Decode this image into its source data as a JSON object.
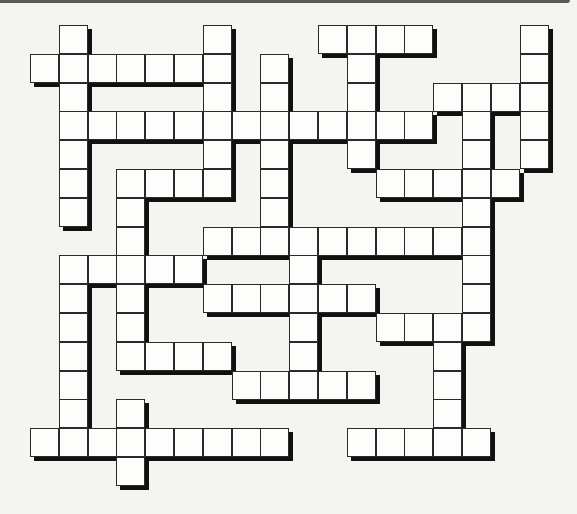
{
  "puzzle": {
    "type": "crossword",
    "cell_size_px": 29,
    "origin_px": {
      "x": 30,
      "y": 25
    },
    "cols": 18,
    "rows": 16,
    "colors": {
      "background": "#f4f4f1",
      "cell_fill": "#fdfdfc",
      "cell_border": "#2a2a2a",
      "shadow": "#111111",
      "top_bar": "#5a5a5a"
    },
    "rows_cells": [
      [
        1,
        6,
        10,
        11,
        12,
        13,
        17
      ],
      [
        0,
        1,
        2,
        3,
        4,
        5,
        6,
        8,
        11,
        17
      ],
      [
        1,
        6,
        8,
        11,
        14,
        15,
        16,
        17
      ],
      [
        1,
        2,
        3,
        4,
        5,
        6,
        7,
        8,
        9,
        10,
        11,
        12,
        13,
        15,
        17
      ],
      [
        1,
        6,
        8,
        11,
        15,
        17
      ],
      [
        1,
        3,
        4,
        5,
        6,
        8,
        12,
        13,
        14,
        15,
        16
      ],
      [
        1,
        3,
        8,
        15
      ],
      [
        3,
        6,
        7,
        8,
        9,
        10,
        11,
        12,
        13,
        14,
        15
      ],
      [
        1,
        2,
        3,
        4,
        5,
        9,
        15
      ],
      [
        1,
        3,
        6,
        7,
        8,
        9,
        10,
        11,
        15
      ],
      [
        1,
        3,
        9,
        12,
        13,
        14,
        15
      ],
      [
        1,
        3,
        4,
        5,
        6,
        9,
        14
      ],
      [
        1,
        7,
        8,
        9,
        10,
        11,
        14
      ],
      [
        1,
        3,
        14
      ],
      [
        0,
        1,
        2,
        3,
        4,
        5,
        6,
        7,
        8,
        11,
        12,
        13,
        14,
        15
      ],
      [
        3
      ]
    ]
  }
}
